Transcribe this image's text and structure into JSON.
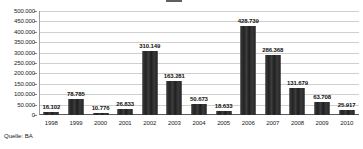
{
  "source_note": "Quelle: BA",
  "chart_data": {
    "type": "bar",
    "title": "",
    "xlabel": "",
    "ylabel": "",
    "ylim": [
      0,
      500000
    ],
    "grid": true,
    "legend": "none",
    "categories": [
      "1998",
      "1999",
      "2000",
      "2001",
      "2002",
      "2003",
      "2004",
      "2005",
      "2006",
      "2007",
      "2008",
      "2009",
      "2010"
    ],
    "values": [
      16102,
      78785,
      10776,
      26833,
      310149,
      163281,
      50673,
      18633,
      428739,
      286368,
      131679,
      63708,
      25917
    ],
    "value_labels": [
      "16.102",
      "78.785",
      "10.776",
      "26.833",
      "310.149",
      "163.281",
      "50.673",
      "18.633",
      "428.739",
      "286.368",
      "131.679",
      "63.708",
      "25.917"
    ],
    "y_ticks": [
      0,
      50000,
      100000,
      150000,
      200000,
      250000,
      300000,
      350000,
      400000,
      450000,
      500000
    ],
    "y_tick_labels": [
      "0",
      "50.000",
      "100.000",
      "150.000",
      "200.000",
      "250.000",
      "300.000",
      "350.000",
      "400.000",
      "450.000",
      "500.000"
    ],
    "bar_color": "#2e2e2e",
    "grid_color": "#cfcfcf",
    "axis_color": "#5a5a5a",
    "background": "#ffffff"
  }
}
